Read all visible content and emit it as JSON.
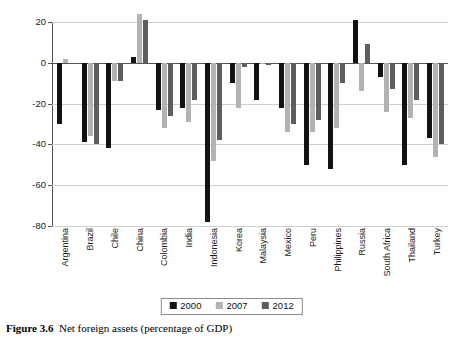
{
  "caption": {
    "figure_number": "Figure 3.6",
    "text": "Net foreign assets (percentage of GDP)"
  },
  "legend": {
    "position": "bottom-center",
    "items": [
      {
        "label": "2000",
        "color": "#131313"
      },
      {
        "label": "2007",
        "color": "#b3b3b3"
      },
      {
        "label": "2012",
        "color": "#5e5e5e"
      }
    ]
  },
  "axis": {
    "y_ticks": [
      "20",
      "0",
      "-20",
      "-40",
      "-60",
      "-80"
    ]
  },
  "chart_data": {
    "type": "bar",
    "title": "Net foreign assets (percentage of GDP)",
    "xlabel": "",
    "ylabel": "",
    "ylim": [
      -80,
      20
    ],
    "yticks": [
      20,
      0,
      -20,
      -40,
      -60,
      -80
    ],
    "grid": true,
    "legend_position": "bottom-center",
    "categories": [
      "Argentina",
      "Brazil",
      "Chile",
      "China",
      "Colombia",
      "India",
      "Indonesia",
      "Korea",
      "Malaysia",
      "Mexico",
      "Peru",
      "Philippines",
      "Russia",
      "South Africa",
      "Thailand",
      "Turkey"
    ],
    "series": [
      {
        "name": "2000",
        "color": "#131313",
        "values": [
          -30,
          -39,
          -42,
          3,
          -23,
          -22,
          -78,
          -10,
          -18,
          -22,
          -50,
          -52,
          21,
          -7,
          -50,
          -37
        ]
      },
      {
        "name": "2007",
        "color": "#b3b3b3",
        "values": [
          2,
          -36,
          -9,
          24,
          -32,
          -29,
          -48,
          -22,
          0,
          -34,
          -34,
          -32,
          -14,
          -24,
          -27,
          -46
        ]
      },
      {
        "name": "2012",
        "color": "#5e5e5e",
        "values": [
          0,
          -40,
          -9,
          21,
          -26,
          -18,
          -38,
          -2,
          -1,
          -30,
          -28,
          -10,
          9,
          -13,
          -18,
          -40
        ]
      }
    ]
  }
}
